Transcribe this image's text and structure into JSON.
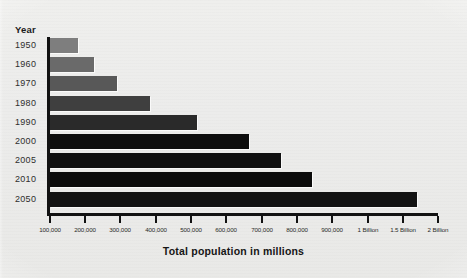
{
  "chart_data": {
    "type": "bar",
    "orientation": "horizontal",
    "title": "Total population in millions",
    "xlabel": "Total population in millions",
    "ylabel": "Year",
    "grid": false,
    "legend": false,
    "categories": [
      "1950",
      "1960",
      "1970",
      "1980",
      "1990",
      "2000",
      "2005",
      "2010",
      "2050"
    ],
    "values": [
      180000,
      230000,
      300000,
      400000,
      560000,
      740000,
      840000,
      930000,
      1600000
    ],
    "value_labels": [
      "180,000",
      "230,000",
      "300,000",
      "400,000",
      "560,000",
      "740,000",
      "840,000",
      "930,000",
      "1.6 Billion"
    ],
    "bar_pixel_ends": [
      78,
      94,
      117,
      150,
      197,
      249,
      281,
      312,
      417
    ],
    "bar_colors": [
      "#7e7e7e",
      "#6a6a6a",
      "#585858",
      "#3f3f3f",
      "#2a2a2a",
      "#0d0d0d",
      "#111111",
      "#0b0b0b",
      "#131313"
    ],
    "xticks": [
      {
        "label": "100,000",
        "x": 49
      },
      {
        "label": "200,000",
        "x": 84
      },
      {
        "label": "300,000",
        "x": 119
      },
      {
        "label": "400,000",
        "x": 155
      },
      {
        "label": "500,000",
        "x": 190
      },
      {
        "label": "600,000",
        "x": 225
      },
      {
        "label": "700,000",
        "x": 261
      },
      {
        "label": "800,000",
        "x": 296
      },
      {
        "label": "900,000",
        "x": 331
      },
      {
        "label": "1 Billion",
        "x": 367
      },
      {
        "label": "1.5 Billion",
        "x": 402
      },
      {
        "label": "2 Billion",
        "x": 437
      }
    ],
    "axis_note": "x-axis spacing is uniform per tick though the last three ticks jump to 1, 1.5 and 2 Billion"
  },
  "labels": {
    "year_header": "Year"
  }
}
